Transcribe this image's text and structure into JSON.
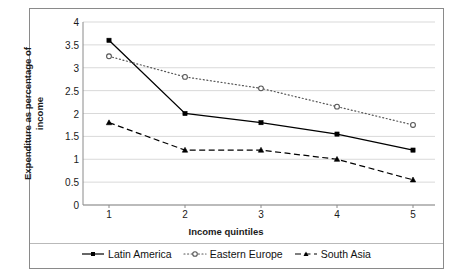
{
  "chart_data": {
    "type": "line",
    "title": "",
    "xlabel": "Income quintiles",
    "ylabel": "Expenditure as percentage of income",
    "ylabel_line1": "Expenditure as percentage of",
    "ylabel_line2": "income",
    "categories": [
      "1",
      "2",
      "3",
      "4",
      "5"
    ],
    "x": [
      1,
      2,
      3,
      4,
      5
    ],
    "ylim": [
      0,
      4
    ],
    "xlim": [
      1,
      5
    ],
    "yticks": [
      "0",
      "0.5",
      "1",
      "1.5",
      "2",
      "2.5",
      "3",
      "3.5",
      "4"
    ],
    "ytick_values": [
      0,
      0.5,
      1,
      1.5,
      2,
      2.5,
      3,
      3.5,
      4
    ],
    "grid": "horizontal",
    "legend_position": "bottom",
    "series": [
      {
        "name": "Latin America",
        "values": [
          3.6,
          2.0,
          1.8,
          1.55,
          1.2
        ],
        "line_style": "solid",
        "marker": "filled-square",
        "color": "#000000"
      },
      {
        "name": "Eastern  Europe",
        "values": [
          3.25,
          2.8,
          2.55,
          2.15,
          1.75
        ],
        "line_style": "dotted",
        "marker": "open-circle",
        "color": "#555555"
      },
      {
        "name": "South Asia",
        "values": [
          1.8,
          1.2,
          1.2,
          1.0,
          0.55
        ],
        "line_style": "dashed",
        "marker": "filled-triangle",
        "color": "#000000"
      }
    ]
  },
  "legend": {
    "items": [
      {
        "label": "Latin America"
      },
      {
        "label": "Eastern  Europe"
      },
      {
        "label": "South Asia"
      }
    ]
  },
  "colors": {
    "frame": "#8a8a8a",
    "grid": "#d9d9d9",
    "text": "#1a1a1a",
    "series_latin_america": "#000000",
    "series_eastern_europe": "#555555",
    "series_south_asia": "#000000"
  }
}
